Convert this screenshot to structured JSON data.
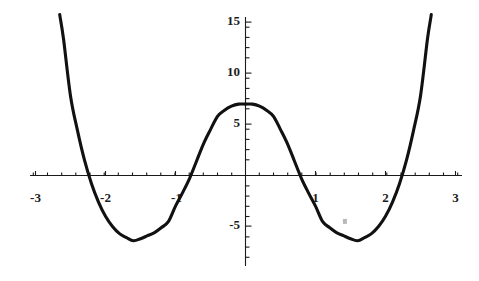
{
  "chart_data": {
    "type": "line",
    "title": "",
    "subtitle": "",
    "xlabel": "",
    "ylabel": "",
    "xlim": [
      -3.05,
      3.05
    ],
    "ylim": [
      -8.0,
      16.5
    ],
    "grid": false,
    "legend_position": "none",
    "x_ticks": [
      -3,
      -2,
      -1,
      1,
      2,
      3
    ],
    "x_tick_labels": [
      "-3",
      "-2",
      "-1",
      "1",
      "2",
      "3"
    ],
    "y_ticks": [
      -5,
      5,
      10,
      15
    ],
    "y_tick_labels": [
      "-5",
      "5",
      "10",
      "15"
    ],
    "x_minor_tick_step": 0.2,
    "y_minor_tick_step": 1,
    "series": [
      {
        "name": "quartic",
        "expression": "x^4 - 5x^2 + 7",
        "color": "#111111",
        "x": [
          -3.05,
          -3.0,
          -2.9,
          -2.8,
          -2.7,
          -2.65,
          -2.6,
          -2.5,
          -2.4,
          -2.3,
          -2.2,
          -2.1,
          -2.0,
          -1.9,
          -1.8,
          -1.7,
          -1.6,
          -1.5,
          -1.4,
          -1.3,
          -1.2,
          -1.1,
          -1.0,
          -0.9,
          -0.8,
          -0.7,
          -0.6,
          -0.5,
          -0.4,
          -0.3,
          -0.2,
          -0.1,
          0.0,
          0.1,
          0.2,
          0.3,
          0.4,
          0.5,
          0.6,
          0.7,
          0.8,
          0.9,
          1.0,
          1.1,
          1.2,
          1.3,
          1.4,
          1.5,
          1.6,
          1.7,
          1.8,
          1.9,
          2.0,
          2.1,
          2.2,
          2.3,
          2.4,
          2.5,
          2.6,
          2.65,
          2.7,
          2.8,
          2.9,
          3.0,
          3.05
        ],
        "y": [
          40.0,
          35.5,
          28.7,
          22.2,
          17.7,
          15.6,
          13.4,
          7.8,
          4.4,
          1.5,
          -0.8,
          -2.6,
          -4.0,
          -5.0,
          -5.7,
          -6.1,
          -6.4,
          -6.2,
          -5.9,
          -5.6,
          -5.1,
          -4.5,
          -3.0,
          -1.7,
          -0.3,
          1.4,
          3.1,
          4.5,
          5.8,
          6.4,
          6.8,
          7.0,
          7.0,
          7.0,
          6.8,
          6.4,
          5.8,
          4.5,
          3.1,
          1.4,
          -0.3,
          -1.7,
          -3.0,
          -4.5,
          -5.1,
          -5.6,
          -5.9,
          -6.2,
          -6.4,
          -6.1,
          -5.7,
          -5.0,
          -4.0,
          -2.6,
          -0.8,
          1.5,
          4.4,
          7.8,
          13.4,
          15.6,
          17.7,
          22.2,
          28.7,
          35.5,
          40.0
        ]
      }
    ],
    "annotations": [
      {
        "name": "stray-pixel-artifact",
        "x": 1.42,
        "y": -4.5
      }
    ],
    "key_points": {
      "local_maximum": {
        "x": 0,
        "y": 7
      },
      "local_minima": [
        {
          "x": -1.58,
          "y": -6.5
        },
        {
          "x": 1.58,
          "y": -6.5
        }
      ],
      "x_intercepts": [
        -2.65,
        -1.0,
        1.0,
        2.65
      ]
    }
  }
}
